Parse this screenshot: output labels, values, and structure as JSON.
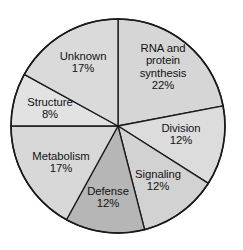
{
  "chart_data": {
    "type": "pie",
    "title": "",
    "subtitle": "",
    "xlabel": "",
    "ylabel": "",
    "legend_position": "none",
    "grid": false,
    "value_unit": "%",
    "start_angle_deg": 0,
    "direction": "clockwise",
    "categories": [
      "RNA and protein synthesis",
      "Division",
      "Signaling",
      "Defense",
      "Metabolism",
      "Structure",
      "Unknown"
    ],
    "values": [
      22,
      12,
      12,
      12,
      17,
      8,
      17
    ],
    "slices": [
      {
        "label": "RNA and\nprotein\nsynthesis",
        "label_lines": [
          "RNA and",
          "protein",
          "synthesis"
        ],
        "name": "RNA and protein synthesis",
        "value": 22,
        "value_text": "22%",
        "color": "#d6d6d6",
        "start_deg": 0,
        "end_deg": 79.2,
        "label_x": 163,
        "label_y": 67
      },
      {
        "label": "Division",
        "label_lines": [
          "Division"
        ],
        "name": "Division",
        "value": 12,
        "value_text": "12%",
        "color": "#dcdcdc",
        "start_deg": 79.2,
        "end_deg": 122.4,
        "label_x": 181,
        "label_y": 134
      },
      {
        "label": "Signaling",
        "label_lines": [
          "Signaling"
        ],
        "name": "Signaling",
        "value": 12,
        "value_text": "12%",
        "color": "#d2d2d2",
        "start_deg": 122.4,
        "end_deg": 165.6,
        "label_x": 158,
        "label_y": 180
      },
      {
        "label": "Defense",
        "label_lines": [
          "Defense"
        ],
        "name": "Defense",
        "value": 12,
        "value_text": "12%",
        "color": "#b6b6b6",
        "start_deg": 165.6,
        "end_deg": 208.8,
        "label_x": 108,
        "label_y": 197
      },
      {
        "label": "Metabolism",
        "label_lines": [
          "Metabolism"
        ],
        "name": "Metabolism",
        "value": 17,
        "value_text": "17%",
        "color": "#d8d8d8",
        "start_deg": 208.8,
        "end_deg": 270,
        "label_x": 61,
        "label_y": 162
      },
      {
        "label": "Structure",
        "label_lines": [
          "Structure"
        ],
        "name": "Structure",
        "value": 8,
        "value_text": "8%",
        "color": "#e2e2e2",
        "start_deg": 270,
        "end_deg": 298.8,
        "label_x": 50,
        "label_y": 108
      },
      {
        "label": "Unknown",
        "label_lines": [
          "Unknown"
        ],
        "name": "Unknown",
        "value": 17,
        "value_text": "17%",
        "color": "#dadada",
        "start_deg": 298.8,
        "end_deg": 360,
        "label_x": 83,
        "label_y": 62
      }
    ],
    "geometry": {
      "center_x": 118,
      "center_y": 126,
      "radius": 107
    },
    "colors": {
      "outline": "#1a1a1a",
      "background": "#ffffff",
      "text": "#121212",
      "highlight_slice": "#b6b6b6"
    }
  }
}
